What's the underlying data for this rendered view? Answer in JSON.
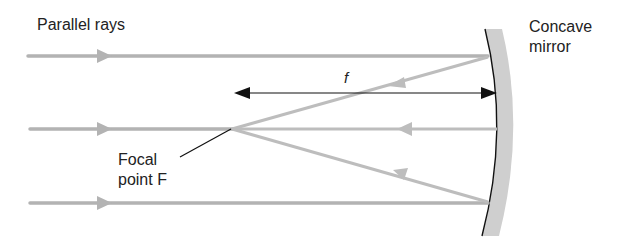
{
  "diagram": {
    "title_labels": {
      "parallel_rays": "Parallel rays",
      "concave_mirror": "Concave\nmirror",
      "focal_point": "Focal\npoint F",
      "focal_length": "f"
    },
    "colors": {
      "ray": "#b3b3b3",
      "mirror_fill": "#cfcfcf",
      "mirror_surface": "#111111",
      "dimension_line": "#111111",
      "text": "#222222"
    },
    "elements": {
      "incident_rays": [
        "top",
        "middle",
        "bottom"
      ],
      "reflected_rays": [
        "top-to-focus",
        "axis",
        "bottom-to-focus"
      ],
      "focal_point": "F",
      "mirror": "concave"
    }
  }
}
